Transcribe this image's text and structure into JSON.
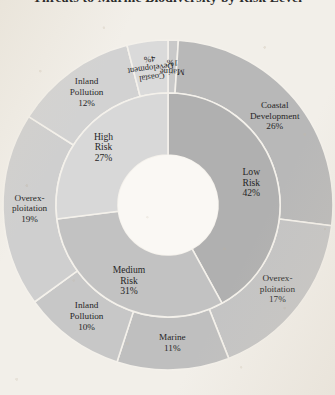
{
  "title": "Threats to Marine Biodiversity by Risk Level",
  "colors": {
    "background": "#f2efe9",
    "hole": "#faf8f4",
    "separator": "#f4f1eb",
    "label_text": "#262626",
    "low_risk": "#b0b0b0",
    "medium_risk": "#c2c2c2",
    "high_risk": "#d8d8d8",
    "outer_dark": "#b8b8b8",
    "outer_mid": "#bfbfbf",
    "outer_light": "#cfcfcf",
    "outer_pale": "#dadada"
  },
  "chart_data": {
    "type": "pie",
    "variant": "sunburst",
    "title": "Threats to Marine Biodiversity by Risk Level",
    "xlabel": "",
    "ylabel": "",
    "units": "percent",
    "center": {
      "x": 168,
      "y": 205
    },
    "radii": {
      "hole": 50,
      "inner_outer_edge": 112,
      "outer_edge": 165
    },
    "start_angle_deg": 0,
    "direction": "clockwise",
    "legend": "none",
    "grid": false,
    "rings": [
      {
        "name": "Risk Level",
        "level": 1,
        "segments": [
          {
            "label": "Low Risk",
            "label_lines": [
              "Low",
              "Risk"
            ],
            "value": 42,
            "value_label": "42%",
            "color": "#b0b0b0",
            "start_deg": 0,
            "end_deg": 151.2
          },
          {
            "label": "Medium Risk",
            "label_lines": [
              "Medium",
              "Risk"
            ],
            "value": 31,
            "value_label": "31%",
            "color": "#c2c2c2",
            "start_deg": 151.2,
            "end_deg": 262.8
          },
          {
            "label": "High Risk",
            "label_lines": [
              "High",
              "Risk"
            ],
            "value": 27,
            "value_label": "27%",
            "color": "#d8d8d8",
            "start_deg": 262.8,
            "end_deg": 360
          }
        ]
      },
      {
        "name": "Threat Type",
        "level": 2,
        "segments": [
          {
            "label": "Marine",
            "label_lines": [
              "Marine"
            ],
            "value": 1,
            "value_label": "1%",
            "parent": "Low Risk",
            "color": "#c9c9c9",
            "start_deg": 0,
            "end_deg": 3.6,
            "rotated": true
          },
          {
            "label": "Coastal Development",
            "label_lines": [
              "Coastal",
              "Development"
            ],
            "value": 26,
            "value_label": "26%",
            "parent": "Low Risk",
            "color": "#b8b8b8",
            "start_deg": 3.6,
            "end_deg": 97.2,
            "rotated": false
          },
          {
            "label": "Overexploitation",
            "label_lines": [
              "Overex-",
              "ploitation"
            ],
            "value": 17,
            "value_label": "17%",
            "parent": "Medium Risk",
            "color": "#c4c4c4",
            "start_deg": 97.2,
            "end_deg": 158.4,
            "rotated": false
          },
          {
            "label": "Marine",
            "label_lines": [
              "Marine"
            ],
            "value": 11,
            "value_label": "11%",
            "parent": "Medium Risk",
            "color": "#bfbfbf",
            "start_deg": 158.4,
            "end_deg": 198.0,
            "rotated": false
          },
          {
            "label": "Inland Pollution",
            "label_lines": [
              "Inland",
              "Pollution"
            ],
            "value": 10,
            "value_label": "10%",
            "parent": "Medium Risk",
            "color": "#c7c7c7",
            "start_deg": 198.0,
            "end_deg": 234.0,
            "rotated": false
          },
          {
            "label": "Overexploitation",
            "label_lines": [
              "Overex-",
              "ploitation"
            ],
            "value": 19,
            "value_label": "19%",
            "parent": "High Risk",
            "color": "#cfcfcf",
            "start_deg": 234.0,
            "end_deg": 302.4,
            "rotated": false
          },
          {
            "label": "Inland Pollution",
            "label_lines": [
              "Inland",
              "Pollution"
            ],
            "value": 12,
            "value_label": "12%",
            "parent": "High Risk",
            "color": "#d2d2d2",
            "start_deg": 302.4,
            "end_deg": 345.6,
            "rotated": false
          },
          {
            "label": "Coastal Development",
            "label_lines": [
              "Coastal",
              "Development"
            ],
            "value": 4,
            "value_label": "4%",
            "parent": "High Risk",
            "color": "#dadada",
            "start_deg": 345.6,
            "end_deg": 360,
            "rotated": true
          }
        ]
      }
    ]
  }
}
